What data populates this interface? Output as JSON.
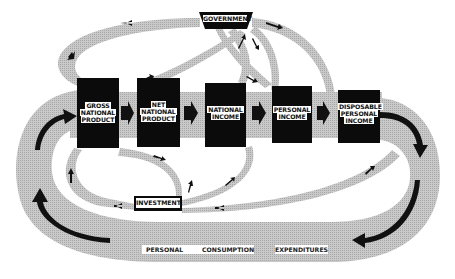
{
  "diagram": {
    "type": "circular-flow-of-income",
    "nodes": [
      {
        "id": "gnp",
        "lines": [
          "GROSS",
          "NATIONAL",
          "PRODUCT"
        ]
      },
      {
        "id": "nnp",
        "lines": [
          "NET",
          "NATIONAL",
          "PRODUCT"
        ]
      },
      {
        "id": "ni",
        "lines": [
          "NATIONAL",
          "INCOME"
        ]
      },
      {
        "id": "pi",
        "lines": [
          "PERSONAL",
          "INCOME"
        ]
      },
      {
        "id": "dpi",
        "lines": [
          "DISPOSABLE",
          "PERSONAL",
          "INCOME"
        ]
      }
    ],
    "government": {
      "label": "GOVERNMENT"
    },
    "investment": {
      "label": "INVESTMENT"
    },
    "consumption": {
      "words": [
        "PERSONAL",
        "CONSUMPTION",
        "EXPENDITURES"
      ]
    },
    "colors": {
      "band": "#c4c4c4",
      "band_dark": "#a9a9a9",
      "node": "#0b0b0b",
      "arrow": "#111111",
      "label_bg": "#ffffff"
    }
  }
}
